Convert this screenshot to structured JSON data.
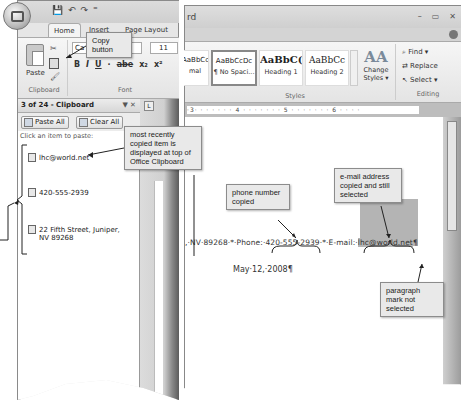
{
  "left_window": {
    "quick_access": [
      "💾",
      "↶",
      "↷",
      "⁼"
    ],
    "tabs": [
      {
        "label": "Home",
        "active": true
      },
      {
        "label": "Insert"
      },
      {
        "label": "Page Layout"
      }
    ],
    "clipboard_group": {
      "paste_label": "Paste",
      "cut_icon": "✂",
      "format_painter_icon": "🖌",
      "label": "Clipboard"
    },
    "font_group": {
      "font_name": "Ca",
      "font_size": "11",
      "format_buttons": [
        "B",
        "I",
        "U",
        "·",
        "abe",
        "x₂",
        "x²"
      ],
      "label": "Font"
    },
    "clipboard_pane": {
      "title": "3 of 24 - Clipboard",
      "controls": "▼ ✕",
      "paste_all": "Paste All",
      "clear_all": "Clear All",
      "instruction": "Click an item to paste:",
      "items": [
        {
          "text": "lhc@world.net"
        },
        {
          "text": "420-555-2939"
        },
        {
          "text": "22 Fifth Street, Juniper,",
          "text2": "NV 89268"
        }
      ]
    }
  },
  "right_window": {
    "title": "rd",
    "window_controls": [
      "–",
      "▭",
      "✕"
    ],
    "styles": [
      {
        "preview": "AaBbCcDc",
        "name": "mal",
        "style": "normal"
      },
      {
        "preview": "AaBbCcDc",
        "name": "¶ No Spaci...",
        "style": "normal",
        "selected": true
      },
      {
        "preview": "AaBbC(",
        "name": "Heading 1",
        "style": "h1"
      },
      {
        "preview": "AaBbCc",
        "name": "Heading 2",
        "style": "h2"
      }
    ],
    "change_styles": {
      "icon": "AA",
      "label": "Change Styles ▾"
    },
    "styles_label": "Styles",
    "editing": {
      "find": "Find ▾",
      "replace": "Replace",
      "select": "Select ▾",
      "label": "Editing"
    },
    "ruler": "·3· · · · · · · 4 · · · · · · · 5 · · · · · · · 6 · · · ·",
    "document": {
      "line1_before": ",·NV·89268·*·Phone:·420-555-2939·*·E-mail:·",
      "line1_selected": "lhc@world.net",
      "line1_after": "¶",
      "line2": "May·12,·2008¶"
    }
  },
  "callouts": {
    "copy_button": "Copy button",
    "most_recent": "most recently copied item is displayed at top of Office Clipboard",
    "phone": "phone number copied",
    "phone_extra": "then ······",
    "email": "e-mail address copied and still selected",
    "paragraph": "paragraph mark not selected"
  },
  "colors": {
    "selection": "#b4b4b4",
    "callout_bg": "#e9e9e9",
    "ribbon_bg": "#ececec"
  }
}
